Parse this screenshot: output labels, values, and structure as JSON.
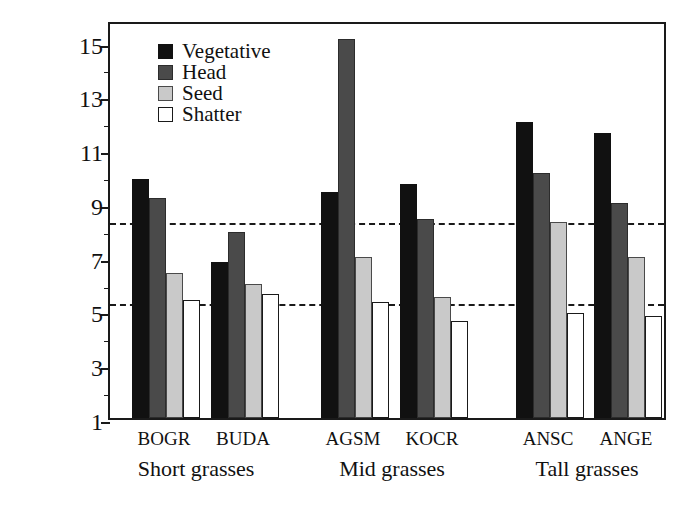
{
  "chart_data": {
    "type": "bar",
    "title": "",
    "xlabel": "",
    "ylabel": "Protein (%)",
    "ylim": [
      1,
      15.8
    ],
    "yticks": [
      1,
      3,
      5,
      7,
      9,
      11,
      13,
      15
    ],
    "ytick_labels": [
      "1",
      "3",
      "5",
      "7",
      "9",
      "11",
      "13",
      "15"
    ],
    "minor_yticks": [
      2,
      4,
      6,
      8,
      10,
      12,
      14
    ],
    "grid": false,
    "legend_position": "top-left",
    "categories": [
      "BOGR",
      "BUDA",
      "AGSM",
      "KOCR",
      "ANSC",
      "ANGE"
    ],
    "groups": [
      {
        "label": "Short grasses",
        "categories": [
          "BOGR",
          "BUDA"
        ]
      },
      {
        "label": "Mid grasses",
        "categories": [
          "AGSM",
          "KOCR"
        ]
      },
      {
        "label": "Tall grasses",
        "categories": [
          "ANSC",
          "ANGE"
        ]
      }
    ],
    "series": [
      {
        "name": "Vegetative",
        "color": "#111111",
        "values": [
          9.9,
          6.8,
          9.4,
          9.7,
          12.0,
          11.6
        ]
      },
      {
        "name": "Head",
        "color": "#4a4a4a",
        "values": [
          9.2,
          7.9,
          15.1,
          8.4,
          10.1,
          9.0
        ]
      },
      {
        "name": "Seed",
        "color": "#c9c9c9",
        "values": [
          6.4,
          6.0,
          7.0,
          5.5,
          8.3,
          7.0
        ]
      },
      {
        "name": "Shatter",
        "color": "#ffffff",
        "values": [
          5.4,
          5.6,
          5.3,
          4.6,
          4.9,
          4.8
        ]
      }
    ],
    "reference_lines": [
      {
        "value": 8.4,
        "style": "dashed"
      },
      {
        "value": 5.4,
        "style": "dashed"
      }
    ],
    "annotations": []
  },
  "legend": {
    "items": [
      {
        "label": "Vegetative",
        "swatch": "vegetative"
      },
      {
        "label": "Head",
        "swatch": "head"
      },
      {
        "label": "Seed",
        "swatch": "seed"
      },
      {
        "label": "Shatter",
        "swatch": "shatter"
      }
    ]
  },
  "colors": {
    "vegetative": "#111111",
    "head": "#4a4a4a",
    "seed": "#c9c9c9",
    "shatter": "#ffffff",
    "axis": "#1a1a1a",
    "background": "#ffffff"
  }
}
